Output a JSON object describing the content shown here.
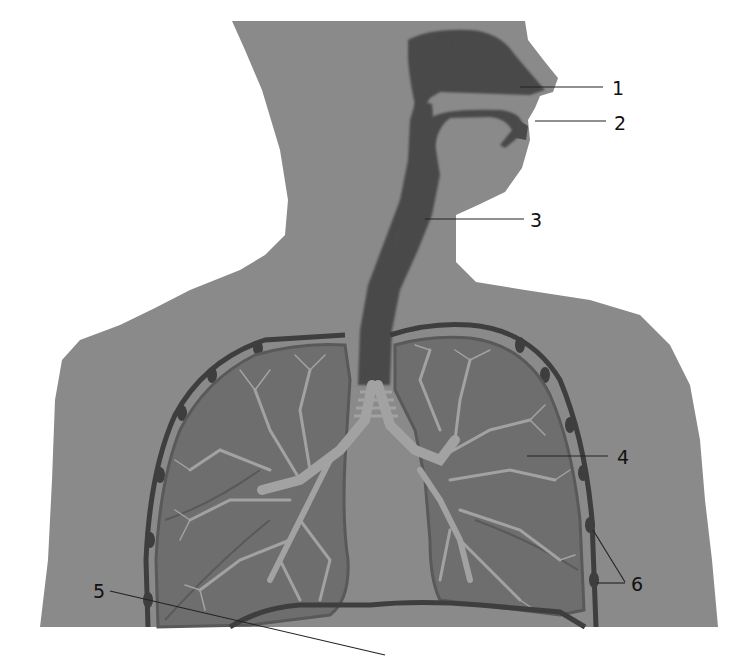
{
  "diagram": {
    "colors": {
      "background": "#ffffff",
      "body": "#8a8a8a",
      "airway": "#4a4a4a",
      "lung": "#6e6e6e",
      "lung_outline": "#595959",
      "bronchi": "#a2a2a2",
      "pleura": "#3e3e3e",
      "label": "#111111",
      "leader": "#222222"
    },
    "labels": [
      {
        "id": "1",
        "text": "1",
        "target": "nasal-cavity"
      },
      {
        "id": "2",
        "text": "2",
        "target": "mouth"
      },
      {
        "id": "3",
        "text": "3",
        "target": "trachea"
      },
      {
        "id": "4",
        "text": "4",
        "target": "lung"
      },
      {
        "id": "5",
        "text": "5",
        "target": "diaphragm"
      },
      {
        "id": "6",
        "text": "6",
        "target": "ribs-pleura"
      }
    ]
  }
}
